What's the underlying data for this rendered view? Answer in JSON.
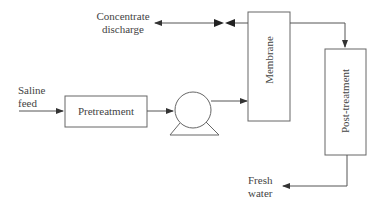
{
  "diagram": {
    "nodes": {
      "saline_feed": {
        "line1": "Saline",
        "line2": "feed"
      },
      "pretreatment": {
        "label": "Pretreatment"
      },
      "pump": {
        "label": "pump"
      },
      "membrane": {
        "label": "Membrane"
      },
      "post_treatment": {
        "label": "Post-treatment"
      },
      "concentrate_discharge": {
        "line1": "Concentrate",
        "line2": "discharge"
      },
      "fresh_water": {
        "line1": "Fresh",
        "line2": "water"
      }
    },
    "edges": [
      {
        "from": "saline_feed",
        "to": "pretreatment"
      },
      {
        "from": "pretreatment",
        "to": "pump"
      },
      {
        "from": "pump",
        "to": "membrane"
      },
      {
        "from": "membrane",
        "to": "concentrate_discharge",
        "via": "valve"
      },
      {
        "from": "membrane",
        "to": "post_treatment"
      },
      {
        "from": "post_treatment",
        "to": "fresh_water"
      }
    ],
    "colors": {
      "line": "#555555",
      "background": "#ffffff"
    }
  }
}
